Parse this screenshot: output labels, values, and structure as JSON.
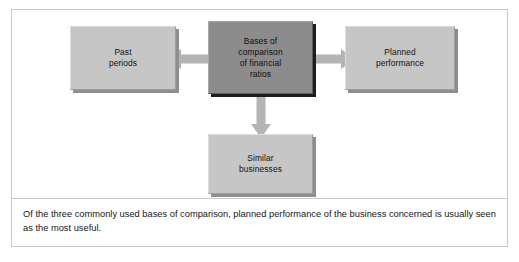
{
  "figure": {
    "diagram": {
      "title": "Bases of comparison of financial ratios",
      "nodes": {
        "center": {
          "label": "Bases of\ncomparison\nof financial\nratios",
          "fill": "#8c8c8c",
          "role": "central-concept"
        },
        "left": {
          "label": "Past\nperiods",
          "fill": "#c6c6c6",
          "role": "basis-of-comparison"
        },
        "right": {
          "label": "Planned\nperformance",
          "fill": "#c6c6c6",
          "role": "basis-of-comparison"
        },
        "bottom": {
          "label": "Similar\nbusinesses",
          "fill": "#c6c6c6",
          "role": "basis-of-comparison"
        }
      },
      "connectors": [
        {
          "name": "arrow-left",
          "direction": "left",
          "from": "center",
          "to": "left"
        },
        {
          "name": "arrow-right",
          "direction": "right",
          "from": "center",
          "to": "right"
        },
        {
          "name": "arrow-down",
          "direction": "down",
          "from": "center",
          "to": "bottom"
        }
      ]
    },
    "caption": {
      "text": "Of the three commonly used bases of comparison, planned performance of the business concerned is usually seen as the most useful."
    },
    "colors": {
      "frame_border": "#c9c9c9",
      "node_fill": "#c6c6c6",
      "center_fill": "#8c8c8c",
      "arrow_fill": "#b4b4b4",
      "text": "#111111",
      "background": "#ffffff"
    }
  }
}
